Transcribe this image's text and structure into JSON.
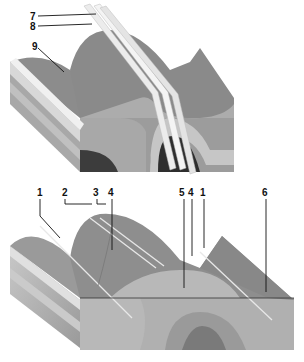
{
  "diagram": {
    "type": "geological block diagram",
    "panels": [
      {
        "id": "top",
        "description": "Folded strata block with two parallel inclined planes cutting through",
        "labels": [
          {
            "text": "7",
            "x": 36,
            "y": 17
          },
          {
            "text": "8",
            "x": 36,
            "y": 27
          },
          {
            "text": "9",
            "x": 36,
            "y": 47
          }
        ]
      },
      {
        "id": "bottom",
        "description": "Eroded folded strata block showing surface traces",
        "labels": [
          {
            "text": "1",
            "x": 40,
            "y": 194
          },
          {
            "text": "2",
            "x": 64,
            "y": 194
          },
          {
            "text": "3",
            "x": 95,
            "y": 194
          },
          {
            "text": "4",
            "x": 110,
            "y": 194
          },
          {
            "text": "5",
            "x": 181,
            "y": 194
          },
          {
            "text": "4",
            "x": 190,
            "y": 194
          },
          {
            "text": "1",
            "x": 202,
            "y": 194
          },
          {
            "text": "6",
            "x": 264,
            "y": 194
          }
        ]
      }
    ],
    "colors": {
      "background": "#ffffff",
      "layer_dark": "#4a4a4a",
      "layer_mid": "#8a8a8a",
      "layer_light": "#b8b8b8",
      "layer_pale": "#d4d4d4",
      "plane": "#e8e8e8",
      "line": "#111111"
    }
  }
}
